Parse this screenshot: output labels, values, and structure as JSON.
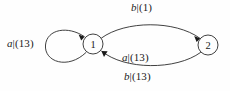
{
  "diagram": {
    "type": "finite-state-transducer",
    "background_color": "#fefefe",
    "line_color": "#2b2b2b",
    "text_color": "#1a1a1a",
    "states": [
      {
        "id": "1",
        "label": "1",
        "cx": 93,
        "cy": 44,
        "r": 10
      },
      {
        "id": "2",
        "label": "2",
        "cx": 208,
        "cy": 45,
        "r": 10
      }
    ],
    "transitions": [
      {
        "name": "self-loop-state-1",
        "from": "1",
        "to": "1",
        "symbol": "a",
        "separator": "|",
        "weight": "(13)",
        "full_label": "a|(13)",
        "label_x": 7,
        "label_y": 38,
        "label_position": "left"
      },
      {
        "name": "edge-1-to-2-top",
        "from": "1",
        "to": "2",
        "symbol": "b",
        "separator": "|",
        "weight": "(1)",
        "full_label": "b|(1)",
        "label_x": 131,
        "label_y": 2,
        "label_position": "above"
      },
      {
        "name": "edge-2-to-1-middle",
        "from": "2",
        "to": "1",
        "symbol": "a",
        "separator": "|",
        "weight": "(13)",
        "full_label": "a|(13)",
        "label_x": 122,
        "label_y": 52,
        "label_position": "inside"
      },
      {
        "name": "edge-2-to-1-bottom",
        "from": "2",
        "to": "1",
        "symbol": "b",
        "separator": "|",
        "weight": "(13)",
        "full_label": "b|(13)",
        "label_x": 124,
        "label_y": 71,
        "label_position": "below"
      }
    ]
  }
}
